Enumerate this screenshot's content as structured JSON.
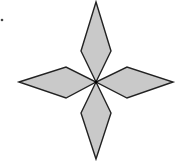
{
  "figure": {
    "fill_color": "#c9c9c9",
    "stroke_color": "#222222",
    "center": [
      96,
      82
    ],
    "petals": [
      {
        "name": "top",
        "points": "96,2 111,51 96,82 81,51"
      },
      {
        "name": "right",
        "points": "173,82 127,98 96,82 127,67"
      },
      {
        "name": "bottom",
        "points": "96,159 81,113 96,82 111,113"
      },
      {
        "name": "left",
        "points": "19,82 66,67 96,82 66,98"
      }
    ],
    "marker_dot": [
      2,
      20
    ]
  }
}
